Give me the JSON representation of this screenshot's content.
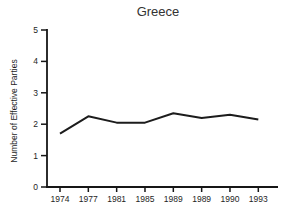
{
  "chart_data": {
    "type": "line",
    "title": "Greece",
    "xlabel": "",
    "ylabel": "Number of Effective Parties",
    "categories": [
      "1974",
      "1977",
      "1981",
      "1985",
      "1989",
      "1989",
      "1990",
      "1993"
    ],
    "values": [
      1.7,
      2.25,
      2.05,
      2.05,
      2.35,
      2.2,
      2.3,
      2.15
    ],
    "ylim": [
      0,
      5
    ],
    "yticks": [
      0,
      1,
      2,
      3,
      4,
      5
    ],
    "grid": false,
    "legend": "none",
    "line_color": "#1c1c1c",
    "axis_color": "#161616",
    "label_color": "#1e1e1e",
    "title_color": "#333333",
    "background_color": "#ffffff"
  }
}
